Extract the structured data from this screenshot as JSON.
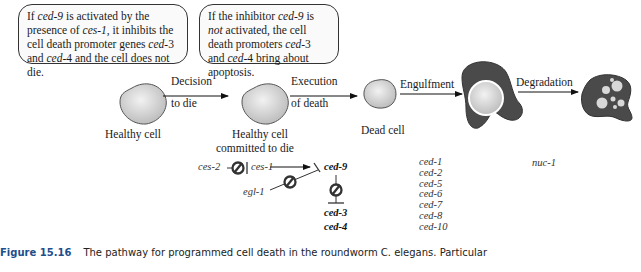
{
  "callouts": {
    "left": {
      "parts": [
        "If ",
        "ced-9",
        " is activated by the presence of ",
        "ces-1",
        ", it inhibits the cell death promoter genes ",
        "ced",
        "-3 and ",
        "ced",
        "-4 and the cell does not die."
      ]
    },
    "right": {
      "parts": [
        "If the inhibitor ",
        "ced-9",
        " is ",
        "not",
        " activated, the cell death promoters ",
        "ced",
        "-3 and ",
        "ced",
        "-4 bring about apoptosis."
      ]
    }
  },
  "stages": {
    "healthy": "Healthy cell",
    "committed_line1": "Healthy cell",
    "committed_line2": "committed to die",
    "dead": "Dead cell"
  },
  "arrows": {
    "decision_line1": "Decision",
    "decision_line2": "to die",
    "execution_line1": "Execution",
    "execution_line2": "of death",
    "engulfment": "Engulfment",
    "degradation": "Degradation"
  },
  "genes": {
    "ces2": "ces-2",
    "ces1": "ces-1",
    "egl1": "egl-1",
    "ced9": "ced-9",
    "ced3": "ced-3",
    "ced4": "ced-4",
    "engulfment_genes": [
      "ced-1",
      "ced-2",
      "ced-5",
      "ced-6",
      "ced-7",
      "ced-8",
      "ced-10"
    ],
    "nuc1": "nuc-1"
  },
  "caption": {
    "label": "Figure 15.16",
    "text": "The pathway for programmed cell death in the roundworm C. elegans. Particular"
  },
  "colors": {
    "cell_fill": "#d8d8d8",
    "phagocyte": "#4a4a4a",
    "caption_label": "#1e4e8c"
  }
}
